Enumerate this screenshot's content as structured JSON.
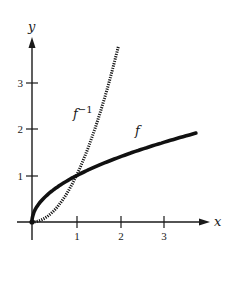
{
  "chart_data": {
    "type": "line",
    "title": "",
    "xlabel": "x",
    "ylabel": "y",
    "xlim": [
      -0.3,
      4
    ],
    "ylim": [
      -0.6,
      4
    ],
    "grid": false,
    "x_ticks": [
      "1",
      "2",
      "3"
    ],
    "y_ticks": [
      "1",
      "2",
      "3"
    ],
    "series": [
      {
        "name": "f",
        "label": "f",
        "style": "solid-thick",
        "function": "sqrt(x)",
        "x": [
          0,
          0.05,
          0.25,
          0.5,
          1,
          1.5,
          2,
          2.5,
          3,
          3.5,
          3.7
        ],
        "y": [
          0,
          0.22,
          0.5,
          0.71,
          1,
          1.22,
          1.41,
          1.58,
          1.73,
          1.87,
          1.92
        ]
      },
      {
        "name": "f^-1",
        "label_base": "f",
        "label_sup": "−1",
        "style": "dotted",
        "function": "x^2",
        "x": [
          0,
          0.25,
          0.5,
          0.75,
          1,
          1.25,
          1.5,
          1.75,
          1.95
        ],
        "y": [
          0,
          0.06,
          0.25,
          0.56,
          1,
          1.56,
          2.25,
          3.06,
          3.8
        ]
      }
    ],
    "annotations": [
      {
        "text": "f",
        "near": [
          2.4,
          1.7
        ]
      },
      {
        "text": "f^-1",
        "near": [
          1.1,
          2.4
        ]
      }
    ]
  },
  "labels": {
    "x_axis": "x",
    "y_axis": "y",
    "f": "f",
    "finv_base": "f",
    "finv_sup": "−1",
    "xt1": "1",
    "xt2": "2",
    "xt3": "3",
    "yt1": "1",
    "yt2": "2",
    "yt3": "3"
  },
  "colors": {
    "ink": "#1a1a1a",
    "background": "#ffffff"
  }
}
